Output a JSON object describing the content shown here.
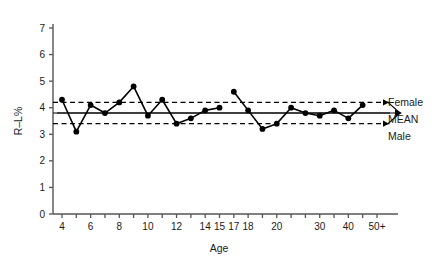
{
  "chart_data": {
    "type": "line",
    "title": "",
    "xlabel": "Age",
    "ylabel": "R–L%",
    "ylim": [
      0,
      7.6
    ],
    "ytick_values": [
      0,
      1,
      2,
      3,
      4,
      5,
      6,
      7
    ],
    "ytick_labels": [
      "0",
      "1",
      "2",
      "3",
      "4",
      "5",
      "6",
      "7"
    ],
    "grid": false,
    "legend_position": "right-outside",
    "x_categories": [
      "4",
      "5",
      "6",
      "7",
      "8",
      "9",
      "10",
      "11",
      "12",
      "13",
      "14",
      "15",
      "17",
      "18",
      "19",
      "20",
      "22",
      "25",
      "30",
      "35",
      "40",
      "45",
      "50+"
    ],
    "xtick_labels": [
      {
        "cat": "4",
        "label": "4"
      },
      {
        "cat": "5",
        "label": ""
      },
      {
        "cat": "6",
        "label": "6"
      },
      {
        "cat": "7",
        "label": ""
      },
      {
        "cat": "8",
        "label": "8"
      },
      {
        "cat": "9",
        "label": ""
      },
      {
        "cat": "10",
        "label": "10"
      },
      {
        "cat": "11",
        "label": ""
      },
      {
        "cat": "12",
        "label": "12"
      },
      {
        "cat": "13",
        "label": ""
      },
      {
        "cat": "14",
        "label": "14"
      },
      {
        "cat": "15",
        "label": "15"
      },
      {
        "cat": "17",
        "label": "17"
      },
      {
        "cat": "18",
        "label": "18"
      },
      {
        "cat": "19",
        "label": ""
      },
      {
        "cat": "20",
        "label": "20"
      },
      {
        "cat": "22",
        "label": ""
      },
      {
        "cat": "25",
        "label": ""
      },
      {
        "cat": "30",
        "label": "30"
      },
      {
        "cat": "35",
        "label": ""
      },
      {
        "cat": "40",
        "label": "40"
      },
      {
        "cat": "45",
        "label": ""
      },
      {
        "cat": "50+",
        "label": "50+"
      }
    ],
    "series": [
      {
        "name": "R-L% by age (children)",
        "marker": "filled-circle",
        "color": "#000000",
        "points": [
          {
            "x": "4",
            "y": 4.3
          },
          {
            "x": "5",
            "y": 3.1
          },
          {
            "x": "6",
            "y": 4.1
          },
          {
            "x": "7",
            "y": 3.8
          },
          {
            "x": "8",
            "y": 4.2
          },
          {
            "x": "9",
            "y": 4.8
          },
          {
            "x": "10",
            "y": 3.7
          },
          {
            "x": "11",
            "y": 4.3
          },
          {
            "x": "12",
            "y": 3.4
          },
          {
            "x": "13",
            "y": 3.6
          },
          {
            "x": "14",
            "y": 3.9
          },
          {
            "x": "15",
            "y": 4.0
          }
        ]
      },
      {
        "name": "R-L% by age (adults)",
        "marker": "filled-circle",
        "color": "#000000",
        "points": [
          {
            "x": "17",
            "y": 4.6
          },
          {
            "x": "18",
            "y": 3.9
          },
          {
            "x": "19",
            "y": 3.2
          },
          {
            "x": "20",
            "y": 3.4
          },
          {
            "x": "22",
            "y": 4.0
          },
          {
            "x": "25",
            "y": 3.8
          },
          {
            "x": "30",
            "y": 3.7
          },
          {
            "x": "35",
            "y": 3.9
          },
          {
            "x": "40",
            "y": 3.6
          },
          {
            "x": "45",
            "y": 4.1
          }
        ]
      }
    ],
    "reference_lines": [
      {
        "name": "Female",
        "value": 4.2,
        "style": "dashed",
        "label": "Female"
      },
      {
        "name": "MEAN",
        "value": 3.8,
        "style": "solid",
        "label": "MEAN"
      },
      {
        "name": "Male",
        "value": 3.4,
        "style": "dashed",
        "label": "Male"
      }
    ],
    "annotations": {
      "bracket": "double-headed-arrow",
      "labels": [
        "Female",
        "MEAN",
        "Male"
      ]
    }
  },
  "axis": {
    "x_title": "Age",
    "y_title": "R–L%"
  },
  "legend": {
    "female": "Female",
    "mean": "MEAN",
    "male": "Male"
  },
  "colors": {
    "ink": "#1a1a1a",
    "line": "#000000",
    "axis": "#555555",
    "background": "#ffffff"
  }
}
